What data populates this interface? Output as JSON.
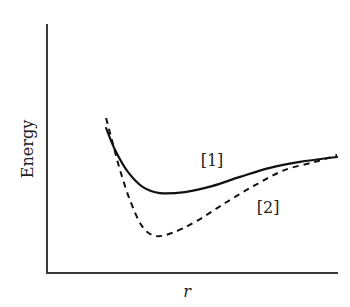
{
  "chart_data": {
    "type": "line",
    "title": "",
    "xlabel": "r",
    "ylabel": "Energy",
    "xlim": [
      0,
      10
    ],
    "ylim": [
      0,
      10
    ],
    "grid": false,
    "ticks": false,
    "legend": "none (inline series labels)",
    "series": [
      {
        "name": "[1]",
        "style": "solid",
        "x": [
          2.03,
          2.34,
          2.78,
          3.3,
          3.88,
          4.74,
          5.67,
          6.63,
          7.66,
          8.69,
          9.97
        ],
        "y": [
          5.82,
          4.94,
          4.06,
          3.45,
          3.21,
          3.25,
          3.49,
          3.86,
          4.22,
          4.46,
          4.66
        ],
        "label_at": [
          5.67,
          4.3
        ]
      },
      {
        "name": "[2]",
        "style": "dashed",
        "x": [
          2.03,
          2.23,
          2.51,
          2.85,
          3.26,
          3.71,
          4.3,
          5.09,
          6.12,
          7.15,
          8.18,
          9.21,
          9.97
        ],
        "y": [
          6.22,
          5.34,
          4.14,
          2.93,
          1.89,
          1.49,
          1.61,
          2.05,
          2.81,
          3.53,
          4.14,
          4.46,
          4.74
        ],
        "label_at": [
          7.6,
          2.4
        ]
      }
    ]
  }
}
